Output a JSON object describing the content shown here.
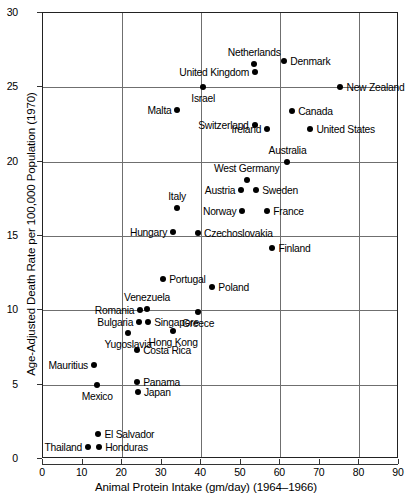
{
  "chart_data": {
    "type": "scatter",
    "title": "",
    "xlabel": "Animal Protein Intake (gm/day) (1964–1966)",
    "ylabel": "Age-Adjusted Death Rate per 100,000 Population (1970)",
    "xlim": [
      0,
      90
    ],
    "ylim": [
      0,
      30
    ],
    "xticks": [
      0,
      10,
      20,
      30,
      40,
      50,
      60,
      70,
      80,
      90
    ],
    "yticks": [
      0,
      5,
      10,
      15,
      20,
      25,
      30
    ],
    "xgridlines": [
      0,
      20,
      40,
      60,
      80
    ],
    "ygridlines": [
      0,
      5,
      10,
      15,
      20,
      25,
      30
    ],
    "grid": true,
    "legend": "none",
    "points": [
      {
        "label": "Netherlands",
        "x": 53.4,
        "y": 26.6,
        "pos": "above"
      },
      {
        "label": "United Kingdom",
        "x": 53.6,
        "y": 26.0,
        "pos": "left"
      },
      {
        "label": "Denmark",
        "x": 61.0,
        "y": 26.8,
        "pos": "right"
      },
      {
        "label": "New Zealand",
        "x": 75.2,
        "y": 25.0,
        "pos": "right"
      },
      {
        "label": "Israel",
        "x": 40.5,
        "y": 25.0,
        "pos": "below"
      },
      {
        "label": "Malta",
        "x": 34.0,
        "y": 23.5,
        "pos": "left"
      },
      {
        "label": "Switzerland",
        "x": 53.5,
        "y": 22.5,
        "pos": "left"
      },
      {
        "label": "Canada",
        "x": 63.0,
        "y": 23.4,
        "pos": "right"
      },
      {
        "label": "United States",
        "x": 67.6,
        "y": 22.2,
        "pos": "right"
      },
      {
        "label": "Ireland",
        "x": 56.7,
        "y": 22.2,
        "pos": "left"
      },
      {
        "label": "Australia",
        "x": 61.8,
        "y": 20.0,
        "pos": "above"
      },
      {
        "label": "West Germany",
        "x": 51.5,
        "y": 18.8,
        "pos": "above"
      },
      {
        "label": "Austria",
        "x": 50.1,
        "y": 18.1,
        "pos": "left"
      },
      {
        "label": "Sweden",
        "x": 53.9,
        "y": 18.1,
        "pos": "right"
      },
      {
        "label": "Norway",
        "x": 50.4,
        "y": 16.7,
        "pos": "left"
      },
      {
        "label": "France",
        "x": 56.7,
        "y": 16.7,
        "pos": "right"
      },
      {
        "label": "Italy",
        "x": 33.9,
        "y": 16.9,
        "pos": "above"
      },
      {
        "label": "Hungary",
        "x": 32.9,
        "y": 15.3,
        "pos": "left"
      },
      {
        "label": "Czechoslovakia",
        "x": 39.2,
        "y": 15.2,
        "pos": "right"
      },
      {
        "label": "Finland",
        "x": 58.0,
        "y": 14.2,
        "pos": "right"
      },
      {
        "label": "Portugal",
        "x": 30.4,
        "y": 12.1,
        "pos": "right"
      },
      {
        "label": "Poland",
        "x": 42.8,
        "y": 11.6,
        "pos": "right"
      },
      {
        "label": "Romania",
        "x": 24.6,
        "y": 10.0,
        "pos": "left"
      },
      {
        "label": "Venezuela",
        "x": 26.3,
        "y": 10.1,
        "pos": "above"
      },
      {
        "label": "Greece",
        "x": 39.2,
        "y": 9.9,
        "pos": "below"
      },
      {
        "label": "Bulgaria",
        "x": 24.3,
        "y": 9.2,
        "pos": "left"
      },
      {
        "label": "Singapore",
        "x": 26.6,
        "y": 9.2,
        "pos": "right"
      },
      {
        "label": "Yugoslavia",
        "x": 21.5,
        "y": 8.5,
        "pos": "below"
      },
      {
        "label": "Hong Kong",
        "x": 32.9,
        "y": 8.6,
        "pos": "below"
      },
      {
        "label": "Costa Rica",
        "x": 23.8,
        "y": 7.3,
        "pos": "right"
      },
      {
        "label": "Mauritius",
        "x": 12.9,
        "y": 6.3,
        "pos": "left"
      },
      {
        "label": "Panama",
        "x": 23.8,
        "y": 5.2,
        "pos": "right"
      },
      {
        "label": "Mexico",
        "x": 13.7,
        "y": 5.0,
        "pos": "below"
      },
      {
        "label": "Japan",
        "x": 24.0,
        "y": 4.5,
        "pos": "right"
      },
      {
        "label": "El Salvador",
        "x": 14.0,
        "y": 1.7,
        "pos": "right"
      },
      {
        "label": "Thailand",
        "x": 11.4,
        "y": 0.8,
        "pos": "left"
      },
      {
        "label": "Honduras",
        "x": 14.2,
        "y": 0.8,
        "pos": "right"
      }
    ]
  }
}
